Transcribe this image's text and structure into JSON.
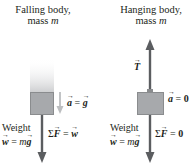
{
  "left_panel": {
    "title_line1": "Falling body,",
    "title_line2_prefix": "mass ",
    "mass_symbol": "m",
    "acceleration_label": {
      "vector": "a",
      "eq": " = ",
      "value_vector": "g"
    },
    "weight_label": "Weight",
    "weight_eq": {
      "vector": "w",
      "eq": " = ",
      "coef": "m",
      "value_vector": "g"
    },
    "net_force": {
      "sigma": "Σ",
      "vector": "F",
      "eq": " = ",
      "value_vector": "w"
    }
  },
  "right_panel": {
    "title_line1": "Hanging body,",
    "title_line2_prefix": "mass ",
    "mass_symbol": "m",
    "tension_label": "T",
    "acceleration_label": {
      "vector": "a",
      "eq": " = ",
      "value": "0"
    },
    "weight_label": "Weight",
    "weight_eq": {
      "vector": "w",
      "eq": " = ",
      "coef": "m",
      "value_vector": "g"
    },
    "net_force": {
      "sigma": "Σ",
      "vector": "F",
      "eq": " = ",
      "value": "0"
    }
  },
  "colors": {
    "block_fill": "#a7a9ac",
    "force_arrow": "#5b5d60",
    "accel_arrow": "#bcbec0",
    "text": "#231f20"
  }
}
